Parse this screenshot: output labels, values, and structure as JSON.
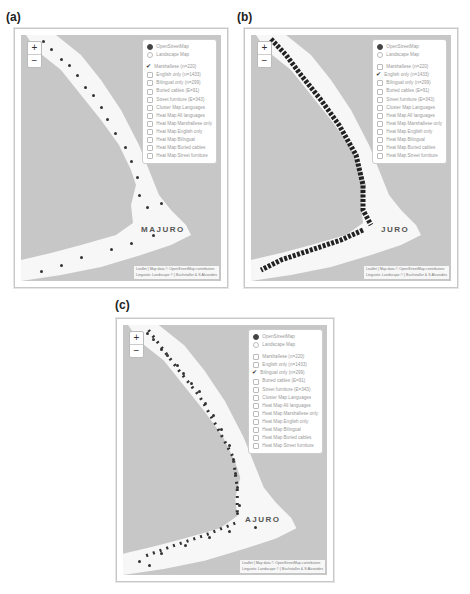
{
  "figure": {
    "panels": [
      {
        "id": "a",
        "label": "(a)",
        "selected_overlay": "Marshallese (n=220)",
        "point_density": "sparse",
        "place_label": "MAJURO"
      },
      {
        "id": "b",
        "label": "(b)",
        "selected_overlay": "English only (n=1433)",
        "point_density": "dense",
        "place_label": "JURO"
      },
      {
        "id": "c",
        "label": "(c)",
        "selected_overlay": "Bilingual only (n=299)",
        "point_density": "medium",
        "place_label": "AJURO"
      }
    ]
  },
  "map": {
    "zoom_in": "+",
    "zoom_out": "−",
    "base_layers": [
      {
        "label": "OpenStreetMap",
        "selected": true
      },
      {
        "label": "Landscape Map",
        "selected": false
      }
    ],
    "overlays": [
      "Marshallese (n=220)",
      "English only (n=1433)",
      "Bilingual only (n=299)",
      "Buried cables (E=91)",
      "Street furniture (E=343)",
      "Cluster Map Languages",
      "Heat Map All languages",
      "Heat Map Marshallese only",
      "Heat Map English only",
      "Heat Map Bilingual",
      "Heat Map Buried cables",
      "Heat Map Street furniture"
    ],
    "attribution_line1": "Leaflet | Map data © OpenStreetMap contributors",
    "attribution_line2": "Linguistic Landscape © | Buchstaller & S Alvanides"
  },
  "colors": {
    "water": "#c7c7c7",
    "land": "#f7f7f7",
    "point": "#333333"
  }
}
